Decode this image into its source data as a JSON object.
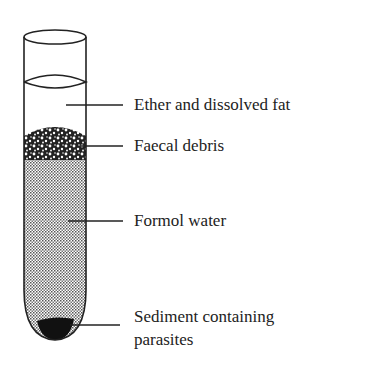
{
  "diagram": {
    "labels": [
      {
        "id": "ether",
        "text": "Ether and dissolved fat"
      },
      {
        "id": "debris",
        "text": "Faecal debris"
      },
      {
        "id": "formol",
        "text": "Formol water"
      },
      {
        "id": "sediment",
        "line1": "Sediment containing",
        "line2": "parasites"
      }
    ],
    "colors": {
      "outline": "#222222",
      "sediment": "#111111",
      "formol_fill": "#b8b8b8"
    }
  }
}
